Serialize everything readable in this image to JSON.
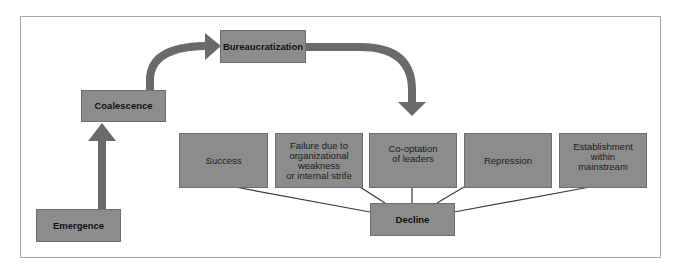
{
  "diagram": {
    "stages": [
      {
        "id": "emergence",
        "label": "Emergence"
      },
      {
        "id": "coalescence",
        "label": "Coalescence"
      },
      {
        "id": "bureaucratization",
        "label": "Bureaucratization"
      },
      {
        "id": "decline",
        "label": "Decline"
      }
    ],
    "outcomes": [
      {
        "id": "success",
        "label": "Success"
      },
      {
        "id": "failure",
        "label": "Failure due to organizational weakness or internal strife",
        "lines": [
          "Failure due to",
          "organizational",
          "weakness",
          "or internal strife"
        ]
      },
      {
        "id": "cooptation",
        "label": "Co-optation of leaders",
        "lines": [
          "Co-optation",
          "of leaders"
        ]
      },
      {
        "id": "repression",
        "label": "Repression"
      },
      {
        "id": "establishment",
        "label": "Establishment within mainstream",
        "lines": [
          "Establishment",
          "within",
          "mainstream"
        ]
      }
    ],
    "colors": {
      "box_fill": "#8c8c8c",
      "arrow_fill": "#6a6a6a",
      "frame_border": "#a8a8a8",
      "connector": "#3a3a3a"
    }
  }
}
